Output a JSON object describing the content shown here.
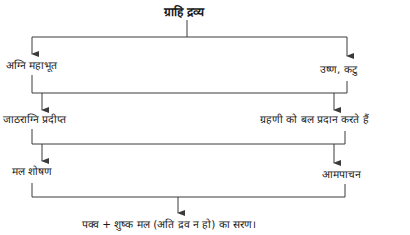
{
  "diagram": {
    "root": "ग्राहि द्रव्य",
    "level1": {
      "left": "अग्नि महाभूत",
      "right": "उष्ण, कटु"
    },
    "level2": {
      "left": "जाठराग्नि प्रदीप्त",
      "right": "ग्रहणी को बल प्रदान करते हैं"
    },
    "level3": {
      "left": "मल शोषण",
      "right": "आमपाचन"
    },
    "result": "पक्व + शुष्क मल (अति द्रव न हो) का सरण।"
  },
  "colors": {
    "line": "#3a3a3a",
    "text": "#1a1a1a",
    "background": "#ffffff"
  }
}
